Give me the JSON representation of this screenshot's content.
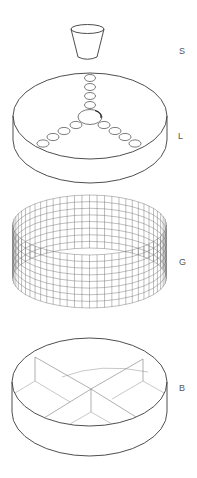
{
  "diagram": {
    "type": "exploded-assembly",
    "background": "#ffffff",
    "line_color": "#3a3a3a",
    "components": [
      {
        "id": "S",
        "label": "S",
        "shape": "tapered-cup"
      },
      {
        "id": "L",
        "label": "L",
        "shape": "cylindrical-lid-with-holes",
        "holes": {
          "center": 1,
          "arms": 3,
          "holes_per_arm": 4
        }
      },
      {
        "id": "G",
        "label": "G",
        "shape": "cylindrical-mesh-grid"
      },
      {
        "id": "B",
        "label": "B",
        "shape": "cylindrical-bowl-with-cross-dividers",
        "compartments": 4
      }
    ]
  }
}
